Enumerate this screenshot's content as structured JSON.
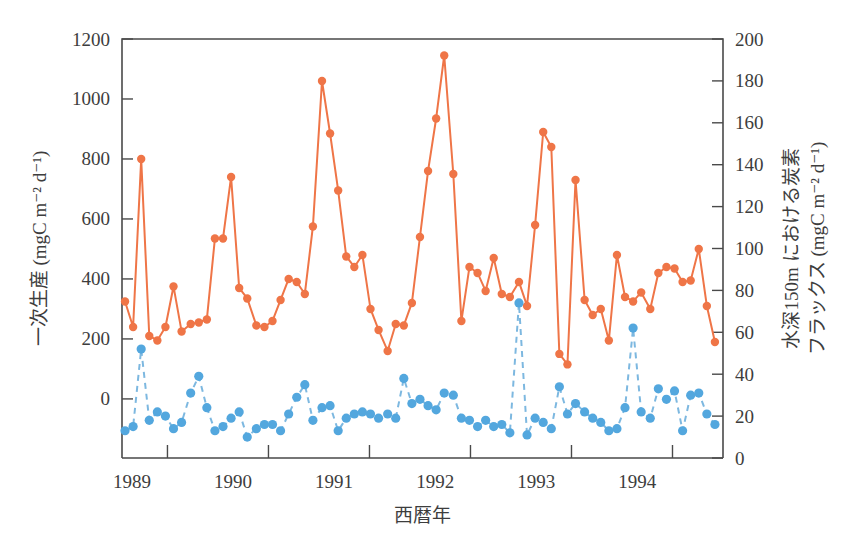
{
  "chart_data": {
    "type": "line",
    "title": "",
    "xlabel": "西暦年",
    "ylabel": "一次生産 (mgC m⁻² d⁻¹)",
    "y2label_line1": "水深150m における炭素",
    "y2label_line2": "フラックス (mgC m⁻² d⁻¹)",
    "xlim": [
      1988.55,
      1994.5
    ],
    "ylim": [
      -197,
      1200
    ],
    "y2lim": [
      0,
      200
    ],
    "grid": false,
    "legend": "none",
    "xticks": [
      1989,
      1990,
      1991,
      1992,
      1993,
      1994
    ],
    "xtick_labels": [
      "1989",
      "1990",
      "1991",
      "1992",
      "1993",
      "1994"
    ],
    "xtick_positions": [
      1988.65,
      1989.65,
      1990.65,
      1991.65,
      1992.65,
      1993.65
    ],
    "yticks": [
      0,
      200,
      400,
      600,
      800,
      1000,
      1200
    ],
    "ytick_labels": [
      "0",
      "200",
      "400",
      "600",
      "800",
      "1000",
      "1200"
    ],
    "y2ticks": [
      0,
      20,
      40,
      60,
      80,
      100,
      120,
      140,
      160,
      180,
      200
    ],
    "y2tick_labels": [
      "0",
      "20",
      "40",
      "60",
      "80",
      "100",
      "120",
      "140",
      "160",
      "180",
      "200"
    ],
    "colors": {
      "primary": "#ef7547",
      "secondary": "#53a7de",
      "secondary_line": "#7db8e0",
      "axis": "#4a4a4a",
      "text": "#3d3d3d",
      "background": "#ffffff"
    },
    "series": [
      {
        "name": "一次生産",
        "axis": "left",
        "color": "#ef7547",
        "style": "solid",
        "marker": "circle",
        "x": [
          1988.58,
          1988.66,
          1988.74,
          1988.82,
          1988.9,
          1988.98,
          1989.06,
          1989.14,
          1989.23,
          1989.31,
          1989.39,
          1989.47,
          1989.55,
          1989.63,
          1989.71,
          1989.79,
          1989.88,
          1989.96,
          1990.04,
          1990.12,
          1990.2,
          1990.28,
          1990.36,
          1990.44,
          1990.53,
          1990.61,
          1990.69,
          1990.77,
          1990.85,
          1990.93,
          1991.01,
          1991.09,
          1991.18,
          1991.26,
          1991.34,
          1991.42,
          1991.5,
          1991.58,
          1991.66,
          1991.74,
          1991.83,
          1991.91,
          1991.99,
          1992.07,
          1992.15,
          1992.23,
          1992.31,
          1992.39,
          1992.48,
          1992.56,
          1992.64,
          1992.72,
          1992.8,
          1992.88,
          1992.96,
          1993.04,
          1993.13,
          1993.21,
          1993.29,
          1993.37,
          1993.45,
          1993.53,
          1993.61,
          1993.69,
          1993.78,
          1993.86,
          1993.94,
          1994.02,
          1994.1,
          1994.18,
          1994.26,
          1994.34,
          1994.42
        ],
        "y": [
          325,
          240,
          800,
          210,
          195,
          240,
          375,
          225,
          250,
          255,
          265,
          535,
          535,
          740,
          370,
          335,
          245,
          240,
          260,
          330,
          400,
          390,
          350,
          575,
          1060,
          885,
          695,
          475,
          440,
          480,
          300,
          230,
          160,
          250,
          245,
          320,
          540,
          760,
          935,
          1145,
          750,
          260,
          440,
          420,
          360,
          470,
          350,
          340,
          390,
          310,
          580,
          890,
          840,
          150,
          115,
          730,
          330,
          280,
          300,
          195,
          480,
          340,
          325,
          355,
          300,
          420,
          440,
          435,
          390,
          395,
          500,
          310,
          190
        ]
      },
      {
        "name": "水深150mにおける炭素フラックス",
        "axis": "right",
        "color": "#53a7de",
        "style": "dashed",
        "marker": "circle",
        "x": [
          1988.58,
          1988.66,
          1988.74,
          1988.82,
          1988.9,
          1988.98,
          1989.06,
          1989.14,
          1989.23,
          1989.31,
          1989.39,
          1989.47,
          1989.55,
          1989.63,
          1989.71,
          1989.79,
          1989.88,
          1989.96,
          1990.04,
          1990.12,
          1990.2,
          1990.28,
          1990.36,
          1990.44,
          1990.53,
          1990.61,
          1990.69,
          1990.77,
          1990.85,
          1990.93,
          1991.01,
          1991.09,
          1991.18,
          1991.26,
          1991.34,
          1991.42,
          1991.5,
          1991.58,
          1991.66,
          1991.74,
          1991.83,
          1991.91,
          1991.99,
          1992.07,
          1992.15,
          1992.23,
          1992.31,
          1992.39,
          1992.48,
          1992.56,
          1992.64,
          1992.72,
          1992.8,
          1992.88,
          1992.96,
          1993.04,
          1993.13,
          1993.21,
          1993.29,
          1993.37,
          1993.45,
          1993.53,
          1993.61,
          1993.69,
          1993.78,
          1993.86,
          1993.94,
          1994.02,
          1994.1,
          1994.18,
          1994.26,
          1994.34,
          1994.42
        ],
        "y": [
          13,
          15,
          52,
          18,
          22,
          20,
          14,
          17,
          31,
          39,
          24,
          13,
          15,
          19,
          22,
          10,
          14,
          16,
          16,
          13,
          21,
          29,
          35,
          18,
          24,
          25,
          13,
          19,
          21,
          22,
          21,
          19,
          21,
          19,
          38,
          26,
          28,
          25,
          23,
          31,
          30,
          19,
          18,
          15,
          18,
          15,
          16,
          12,
          74,
          11,
          19,
          17,
          14,
          34,
          21,
          26,
          22,
          19,
          17,
          13,
          14,
          24,
          62,
          22,
          19,
          33,
          28,
          32,
          13,
          30,
          31,
          21,
          16
        ]
      }
    ]
  },
  "layout": {
    "plot_left": 122,
    "plot_right": 723,
    "plot_top": 39,
    "plot_bottom": 458
  }
}
